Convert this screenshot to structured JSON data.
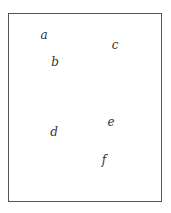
{
  "diagram": {
    "labels": [
      "a",
      "b",
      "c",
      "d",
      "e",
      "f"
    ],
    "colors": {
      "border": "#555555",
      "text": "#333333",
      "background": "#ffffff"
    }
  }
}
